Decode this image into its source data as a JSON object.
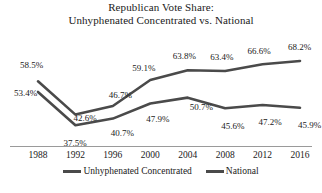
{
  "chart_data": {
    "type": "line",
    "title": "Republican Vote Share: Unhyphenated Concentrated vs. National",
    "title_lines": [
      "Republican Vote Share:",
      "Unhyphenated Concentrated vs. National"
    ],
    "xlabel": "",
    "ylabel": "",
    "x": [
      1988,
      1992,
      1996,
      2000,
      2004,
      2008,
      2012,
      2016
    ],
    "categories": [
      "1988",
      "1992",
      "1996",
      "2000",
      "2004",
      "2008",
      "2012",
      "2016"
    ],
    "ylim": [
      30,
      72
    ],
    "grid": false,
    "legend_position": "bottom",
    "series": [
      {
        "name": "Unhyphenated Concentrated",
        "color": "#4a4a4a",
        "values": [
          58.5,
          42.6,
          46.7,
          59.1,
          63.8,
          63.4,
          66.6,
          68.2
        ],
        "labels": [
          "58.5%",
          "42.6%",
          "46.7%",
          "59.1%",
          "63.8%",
          "63.4%",
          "66.6%",
          "68.2%"
        ]
      },
      {
        "name": "National",
        "color": "#4a4a4a",
        "values": [
          53.4,
          37.5,
          40.7,
          47.9,
          50.7,
          45.6,
          47.2,
          45.9
        ],
        "labels": [
          "53.4%",
          "37.5%",
          "40.7%",
          "47.9%",
          "50.7%",
          "45.6%",
          "47.2%",
          "45.9%"
        ]
      }
    ]
  },
  "legend": {
    "items": [
      {
        "label": "Unhyphenated Concentrated"
      },
      {
        "label": "National"
      }
    ]
  },
  "colors": {
    "line": "#4a4a4a",
    "axis": "#9a9a9a",
    "text": "#1a1a1a",
    "background": "#ffffff"
  }
}
